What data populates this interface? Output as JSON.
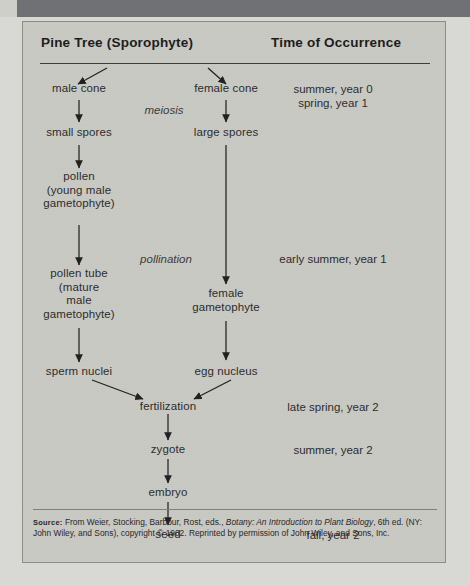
{
  "figure": {
    "headers": {
      "left": "Pine Tree (Sporophyte)",
      "right": "Time of Occurrence"
    },
    "nodes": {
      "male_cone": "male cone",
      "small_spores": "small spores",
      "pollen": "pollen\n(young male\ngametophyte)",
      "pollen_tube": "pollen tube\n(mature\nmale\ngametophyte)",
      "sperm_nuclei": "sperm nuclei",
      "female_cone": "female cone",
      "large_spores": "large spores",
      "female_gametophyte": "female\ngametophyte",
      "egg_nucleus": "egg nucleus",
      "fertilization": "fertilization",
      "zygote": "zygote",
      "embryo": "embryo",
      "seed": "seed"
    },
    "process_labels": {
      "meiosis": "meiosis",
      "pollination": "pollination"
    },
    "times": {
      "cones": "summer, year 0\nspring, year 1",
      "pollination": "early summer, year 1",
      "fertilization": "late spring, year 2",
      "zygote": "summer, year 2",
      "seed": "fall, year 2"
    },
    "source": {
      "label": "Source:",
      "part1": " From Weier, Stocking, Barbour, Rost, eds., ",
      "title": "Botany: An Introduction to Plant Biology",
      "part2": ", 6th ed. (NY: John Wiley, and Sons), copyright © 1902. Reprinted by permission of John Wiley, and Sons, Inc."
    }
  }
}
